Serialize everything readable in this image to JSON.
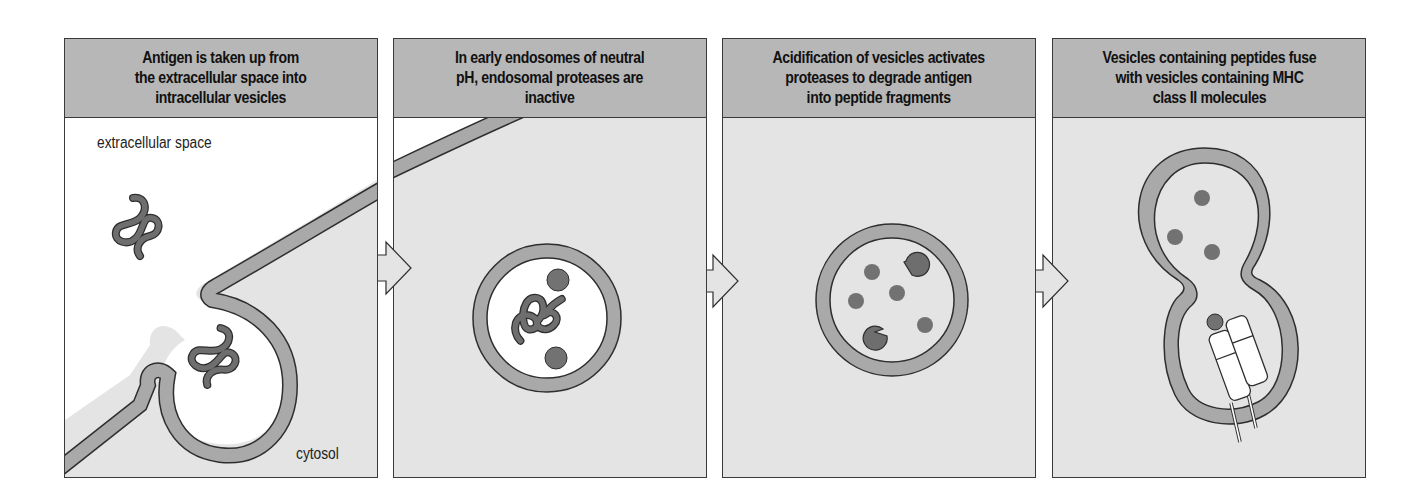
{
  "figure": {
    "panels": [
      {
        "id": 1,
        "title": "Antigen is taken up from\nthe extracellular space into\nintracellular vesicles"
      },
      {
        "id": 2,
        "title": "In early endosomes of neutral\npH, endosomal proteases are\ninactive"
      },
      {
        "id": 3,
        "title": "Acidification of vesicles activates\nproteases to degrade antigen\ninto peptide fragments"
      },
      {
        "id": 4,
        "title": "Vesicles containing peptides fuse\nwith vesicles containing MHC\nclass II molecules"
      }
    ],
    "labels": {
      "extracellular": "extracellular space",
      "cytosol": "cytosol"
    },
    "colors": {
      "header_bg": "#b7b7b7",
      "cytosol_bg": "#e4e4e4",
      "extracellular_bg": "#ffffff",
      "membrane": "#a9a9a9",
      "outline": "#2e2e2e",
      "antigen": "#6e6e6e",
      "peptide": "#727272"
    }
  }
}
